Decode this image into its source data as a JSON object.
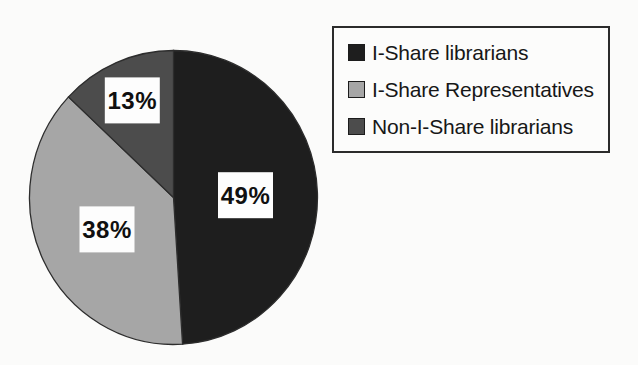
{
  "chart_data": {
    "type": "pie",
    "title": "",
    "categories": [
      "I-Share librarians",
      "I-Share Representatives",
      "Non-I-Share librarians"
    ],
    "values": [
      49,
      38,
      13
    ],
    "unit": "%",
    "slice_labels": [
      "49%",
      "38%",
      "13%"
    ],
    "colors": [
      "#1e1e1e",
      "#a6a6a6",
      "#4c4c4c"
    ],
    "label_box_color": "#fdfdfd",
    "outline_color": "#2d2d2d",
    "start_angle_deg": 0,
    "direction": "clockwise",
    "legend_position": "top-right",
    "legend_border_color": "#2b2b2b",
    "label_radius_factors": [
      0.5,
      0.51,
      0.72
    ]
  }
}
